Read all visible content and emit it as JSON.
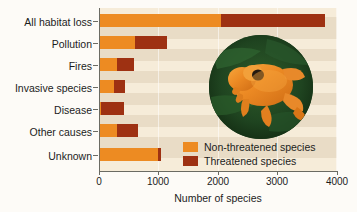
{
  "chart_data": {
    "type": "bar",
    "orientation": "horizontal",
    "stacked": true,
    "title": "",
    "xlabel": "Number of species",
    "ylabel": "",
    "xlim": [
      0,
      4000
    ],
    "xticks": [
      0,
      1000,
      2000,
      3000,
      4000
    ],
    "xtick_labels": [
      "0",
      "1000",
      "2000",
      "3000",
      "4000"
    ],
    "grid": true,
    "legend_position": "inside-lower-right",
    "categories": [
      "All habitat loss",
      "Pollution",
      "Fires",
      "Invasive species",
      "Disease",
      "Other causes",
      "Unknown"
    ],
    "series": [
      {
        "name": "Non-threatened species",
        "color": "#ed8b22",
        "values": [
          2050,
          600,
          300,
          250,
          30,
          300,
          990
        ]
      },
      {
        "name": "Threatened species",
        "color": "#9e3112",
        "values": [
          1750,
          540,
          290,
          190,
          390,
          350,
          50
        ]
      }
    ],
    "totals": [
      3800,
      1140,
      590,
      440,
      420,
      650,
      1040
    ],
    "annotations": [
      "circular inset photograph of a golden toad on dark green leaves"
    ]
  },
  "legend": {
    "items": [
      {
        "label": "Non-threatened species",
        "color": "#ed8b22"
      },
      {
        "label": "Threatened species",
        "color": "#9e3112"
      }
    ]
  },
  "axis": {
    "x_title": "Number of species",
    "tick_labels": [
      "0",
      "1000",
      "2000",
      "3000",
      "4000"
    ]
  },
  "categories": [
    "All habitat loss",
    "Pollution",
    "Fires",
    "Invasive species",
    "Disease",
    "Other causes",
    "Unknown"
  ],
  "colors": {
    "non_threatened": "#ed8b22",
    "threatened": "#9e3112",
    "panel_background": "#e9dcc6",
    "panel_band": "#f6ecd9",
    "page_background": "#fdfbf7",
    "axis": "#6b6b63",
    "photo_background": "#1e4420",
    "frog_body": "#e8892a"
  }
}
